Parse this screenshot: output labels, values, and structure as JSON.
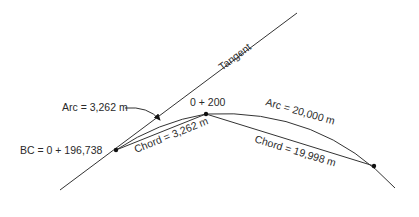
{
  "diagram": {
    "type": "curve-layout",
    "labels": {
      "tangent": "Tangent",
      "bc_station": "BC = 0 + 196,738",
      "station_200": "0 + 200",
      "arc_short": "Arc = 3,262 m",
      "chord_short": "Chord = 3,262 m",
      "arc_long": "Arc = 20,000 m",
      "chord_long": "Chord = 19,998 m"
    },
    "points": {
      "bc": {
        "x": 116,
        "y": 150
      },
      "sta_200": {
        "x": 206,
        "y": 114
      },
      "sta_220": {
        "x": 374,
        "y": 166
      }
    },
    "colors": {
      "line": "#333333",
      "text": "#2a2a2a",
      "background": "#ffffff"
    }
  }
}
